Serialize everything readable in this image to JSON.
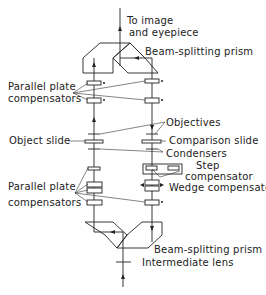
{
  "diagram": {
    "type": "optical-schematic",
    "labels": {
      "top_output": [
        "To image",
        "and eyepiece"
      ],
      "top_prism": "Beam-splitting prism",
      "upper_compensators": [
        "Parallel plate",
        "compensators"
      ],
      "objectives": "Objectives",
      "object_slide": "Object slide",
      "comparison_slide": "Comparison slide",
      "condensers": "Condensers",
      "step_compensator": [
        "Step",
        "compensator"
      ],
      "wedge_compensator": "Wedge compensator",
      "lower_compensators": [
        "Parallel plate",
        "compensators"
      ],
      "bottom_prism": "Beam-splitting prism",
      "intermediate_lens": "Intermediate lens"
    },
    "colors": {
      "line": "#222222",
      "background": "#ffffff"
    }
  }
}
